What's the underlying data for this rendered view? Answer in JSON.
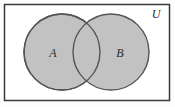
{
  "figure": {
    "kind": "venn-diagram",
    "caption_visible": false,
    "background_color": "#fdfdfd",
    "universe": {
      "label": "U",
      "label_position": {
        "x": 156,
        "y": 18
      },
      "frame": {
        "x": 4.5,
        "y": 4.5,
        "width": 165,
        "height": 96,
        "stroke_color": "#3a3a3a",
        "stroke_width": 1.5,
        "fill_color": "#ffffff"
      }
    },
    "sets": [
      {
        "label": "A",
        "center_x": 62,
        "center_y": 52,
        "radius": 38,
        "fill_color": "#c2c2c2",
        "stroke_color": "#555555",
        "stroke_width": 1.4,
        "label_x": 53,
        "label_y": 57
      },
      {
        "label": "B",
        "center_x": 111,
        "center_y": 52,
        "radius": 38,
        "fill_color": "#c2c2c2",
        "stroke_color": "#555555",
        "stroke_width": 1.4,
        "label_x": 120,
        "label_y": 57
      }
    ],
    "intersection": {
      "shaded": true,
      "fill_color": "#c2c2c2",
      "note_visible": false
    }
  }
}
